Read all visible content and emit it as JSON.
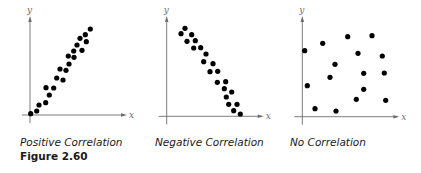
{
  "figure_label": "Figure 2.60",
  "colors": {
    "dot": "#000000",
    "axis": "#6e6e6e",
    "text": "#1a1a1a"
  },
  "chart_data": [
    {
      "type": "scatter",
      "title": "Positive Correlation",
      "xlabel": "x",
      "ylabel": "y",
      "grid": false,
      "ticks": false,
      "origin_px": [
        30,
        115
      ],
      "points_px": [
        [
          30.7,
          113.7
        ],
        [
          36.7,
          111
        ],
        [
          39,
          105
        ],
        [
          45.7,
          102.7
        ],
        [
          49.3,
          95
        ],
        [
          46,
          87.7
        ],
        [
          53.7,
          88
        ],
        [
          56.7,
          78
        ],
        [
          60,
          69
        ],
        [
          63,
          80
        ],
        [
          66,
          70.3
        ],
        [
          69,
          64
        ],
        [
          68.3,
          56
        ],
        [
          73.7,
          51
        ],
        [
          74,
          57.3
        ],
        [
          77,
          45
        ],
        [
          80,
          38.3
        ],
        [
          82,
          50.3
        ],
        [
          85.3,
          34.7
        ],
        [
          86.3,
          41.7
        ],
        [
          90.3,
          29
        ]
      ]
    },
    {
      "type": "scatter",
      "title": "Negative Correlation",
      "xlabel": "x",
      "ylabel": "y",
      "grid": false,
      "ticks": false,
      "origin_px": [
        166.7,
        116.3
      ],
      "points_px": [
        [
          181,
          33.7
        ],
        [
          185,
          28.3
        ],
        [
          187,
          41.3
        ],
        [
          191.7,
          34.7
        ],
        [
          193.7,
          48
        ],
        [
          195.3,
          40.7
        ],
        [
          200.7,
          47.7
        ],
        [
          206,
          54
        ],
        [
          203.7,
          61.7
        ],
        [
          210,
          71.7
        ],
        [
          213,
          63.7
        ],
        [
          217.7,
          71.3
        ],
        [
          217.3,
          82.3
        ],
        [
          224.3,
          88.7
        ],
        [
          225.7,
          81.7
        ],
        [
          231.7,
          92
        ],
        [
          226.3,
          97
        ],
        [
          228.7,
          104.3
        ],
        [
          237,
          104.3
        ],
        [
          233.7,
          110.7
        ],
        [
          240.3,
          114
        ]
      ]
    },
    {
      "type": "scatter",
      "title": "No Correlation",
      "xlabel": "x",
      "ylabel": "y",
      "grid": false,
      "ticks": false,
      "origin_px": [
        302.3,
        116.7
      ],
      "points_px": [
        [
          304.7,
          50.7
        ],
        [
          322.7,
          43.3
        ],
        [
          347.7,
          36.7
        ],
        [
          372,
          35.7
        ],
        [
          358,
          53.3
        ],
        [
          382.3,
          56
        ],
        [
          335,
          64.3
        ],
        [
          330,
          77.3
        ],
        [
          363.7,
          73.3
        ],
        [
          384.3,
          73
        ],
        [
          307.3,
          85.7
        ],
        [
          363.7,
          89.3
        ],
        [
          356.3,
          99.3
        ],
        [
          385.7,
          100.3
        ],
        [
          315,
          108.7
        ],
        [
          336,
          111
        ]
      ]
    }
  ]
}
